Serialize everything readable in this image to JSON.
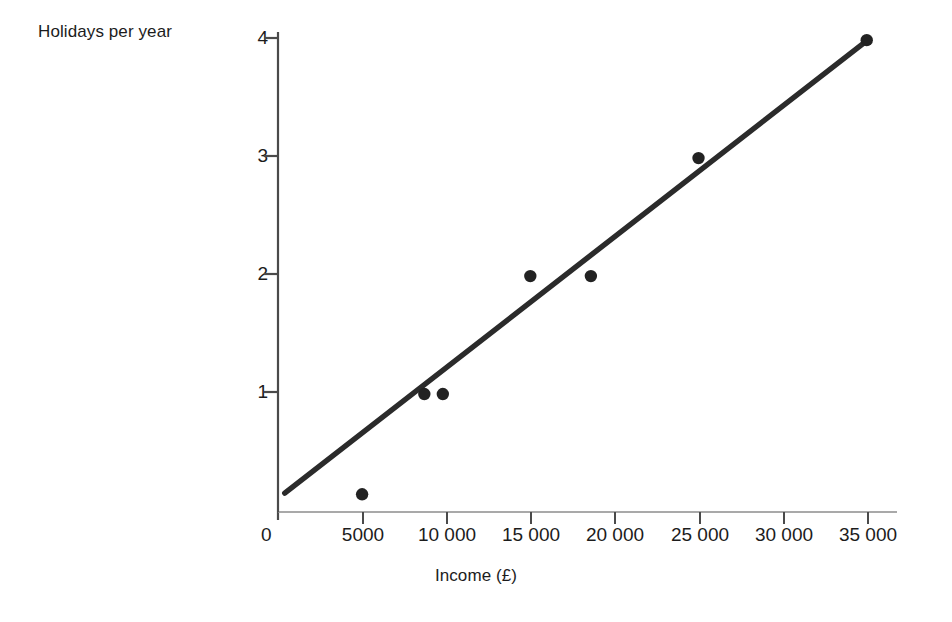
{
  "chart_data": {
    "type": "scatter",
    "title": "",
    "xlabel": "Income (£)",
    "ylabel": "Holidays per year",
    "xlim": [
      0,
      36800
    ],
    "ylim": [
      0,
      4.12
    ],
    "grid": false,
    "legend": "none",
    "x_tick_labels": [
      "0",
      "5000",
      "10 000",
      "15 000",
      "20 000",
      "25 000",
      "30 000",
      "35 000"
    ],
    "x_tick_values": [
      0,
      5000,
      10000,
      15000,
      20000,
      25000,
      30000,
      35000
    ],
    "y_tick_labels": [
      "0",
      "1",
      "2",
      "3",
      "4"
    ],
    "y_tick_values": [
      0,
      1,
      2,
      3,
      4
    ],
    "points": [
      {
        "x": 5000,
        "y": 0.15
      },
      {
        "x": 8700,
        "y": 1
      },
      {
        "x": 9800,
        "y": 1
      },
      {
        "x": 15000,
        "y": 2
      },
      {
        "x": 18600,
        "y": 2
      },
      {
        "x": 25000,
        "y": 3
      },
      {
        "x": 35000,
        "y": 4
      }
    ],
    "trend_line": {
      "label": "line of best fit",
      "x_start": 400,
      "y_start": 0.16,
      "x_end": 35050,
      "y_end": 4.0
    },
    "marker_color": "#222222",
    "line_color": "#2b2b2b",
    "axis_color": "#4a4a4a"
  },
  "axes": {
    "y_title": "Holidays per year",
    "x_title": "Income (£)",
    "origin": "0",
    "y_ticks": [
      {
        "label": "4"
      },
      {
        "label": "3"
      },
      {
        "label": "2"
      },
      {
        "label": "1"
      }
    ],
    "x_ticks": [
      {
        "label": "5000"
      },
      {
        "label": "10 000"
      },
      {
        "label": "15 000"
      },
      {
        "label": "20 000"
      },
      {
        "label": "25 000"
      },
      {
        "label": "30 000"
      },
      {
        "label": "35 000"
      }
    ]
  }
}
